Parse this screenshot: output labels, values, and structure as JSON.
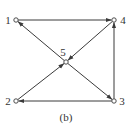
{
  "caption": "(b)",
  "colors": {
    "stroke": "#3a3a3a",
    "node_fill": "#ffffff",
    "background": "#ffffff"
  },
  "nodes": [
    {
      "id": "1",
      "label": "1",
      "x": 16,
      "y": 20
    },
    {
      "id": "2",
      "label": "2",
      "x": 16,
      "y": 101
    },
    {
      "id": "3",
      "label": "3",
      "x": 114,
      "y": 101
    },
    {
      "id": "4",
      "label": "4",
      "x": 114,
      "y": 20
    },
    {
      "id": "5",
      "label": "5",
      "x": 66,
      "y": 62
    }
  ],
  "edges": [
    {
      "from": "1",
      "to": "4"
    },
    {
      "from": "5",
      "to": "1"
    },
    {
      "from": "4",
      "to": "5"
    },
    {
      "from": "2",
      "to": "5"
    },
    {
      "from": "5",
      "to": "3"
    },
    {
      "from": "3",
      "to": "2"
    },
    {
      "from": "3",
      "to": "4"
    }
  ]
}
